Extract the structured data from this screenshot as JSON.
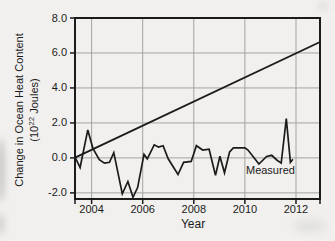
{
  "figure": {
    "background": "#f1f0ee",
    "line_color": "#1b1b1b",
    "grid_color": "#a3a3a1",
    "text_color": "#1b1b1b"
  },
  "chart_data": {
    "type": "line",
    "title": "",
    "xlabel": "Year",
    "ylabel_line1": "Change in Ocean Heat Content",
    "ylabel_parts": {
      "prefix": "(10",
      "sup": "22",
      "suffix": " Joules)"
    },
    "xlim": [
      2003.35,
      2012.94
    ],
    "ylim": [
      -2.35,
      8.0
    ],
    "x_ticks": [
      2004,
      2006,
      2008,
      2010,
      2012
    ],
    "x_tick_labels": [
      "2004",
      "2006",
      "2008",
      "2010",
      "2012"
    ],
    "y_ticks": [
      -2.0,
      0.0,
      2.0,
      4.0,
      6.0,
      8.0
    ],
    "y_tick_labels": [
      "-2.0",
      "0.0",
      "2.0",
      "4.0",
      "6.0",
      "8.0"
    ],
    "grid": true,
    "legend_position": "none",
    "series": [
      {
        "name": "trend",
        "label": "",
        "points": [
          [
            2003.35,
            0.02
          ],
          [
            2012.94,
            6.63
          ]
        ]
      },
      {
        "name": "measured",
        "label": "Measured",
        "points": [
          [
            2003.35,
            0.05
          ],
          [
            2003.55,
            -0.55
          ],
          [
            2003.85,
            1.6
          ],
          [
            2004.05,
            0.55
          ],
          [
            2004.3,
            -0.1
          ],
          [
            2004.5,
            -0.3
          ],
          [
            2004.7,
            -0.25
          ],
          [
            2004.87,
            0.3
          ],
          [
            2005.2,
            -2.05
          ],
          [
            2005.42,
            -1.35
          ],
          [
            2005.62,
            -2.25
          ],
          [
            2005.8,
            -1.7
          ],
          [
            2006.05,
            0.2
          ],
          [
            2006.18,
            -0.05
          ],
          [
            2006.45,
            0.75
          ],
          [
            2006.62,
            0.62
          ],
          [
            2006.8,
            0.7
          ],
          [
            2007.0,
            -0.05
          ],
          [
            2007.38,
            -0.95
          ],
          [
            2007.6,
            -0.25
          ],
          [
            2007.9,
            -0.2
          ],
          [
            2008.1,
            0.7
          ],
          [
            2008.35,
            0.45
          ],
          [
            2008.6,
            0.5
          ],
          [
            2008.85,
            -1.0
          ],
          [
            2009.02,
            0.1
          ],
          [
            2009.2,
            -0.85
          ],
          [
            2009.4,
            0.35
          ],
          [
            2009.55,
            0.58
          ],
          [
            2010.0,
            0.58
          ],
          [
            2010.12,
            0.45
          ],
          [
            2010.55,
            -0.35
          ],
          [
            2010.85,
            0.08
          ],
          [
            2011.05,
            0.15
          ],
          [
            2011.25,
            -0.12
          ],
          [
            2011.42,
            -0.3
          ],
          [
            2011.62,
            2.25
          ],
          [
            2011.78,
            -0.25
          ],
          [
            2011.88,
            -0.08
          ]
        ]
      }
    ],
    "annotation": {
      "text": "Measured",
      "x": 2011.0,
      "y": -0.92
    }
  }
}
